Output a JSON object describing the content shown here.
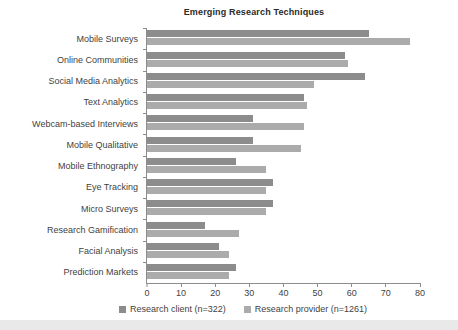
{
  "chart_data": {
    "type": "bar",
    "orientation": "horizontal",
    "title": "Emerging Research Techniques",
    "xlabel": "",
    "ylabel": "",
    "xlim": [
      0,
      80
    ],
    "xticks": [
      0,
      10,
      20,
      30,
      40,
      50,
      60,
      70,
      80
    ],
    "grid": false,
    "legend_position": "bottom",
    "categories": [
      "Mobile Surveys",
      "Online Communities",
      "Social Media Analytics",
      "Text Analytics",
      "Webcam-based Interviews",
      "Mobile Qualitative",
      "Mobile Ethnography",
      "Eye Tracking",
      "Micro Surveys",
      "Research Gamification",
      "Facial Analysis",
      "Prediction Markets"
    ],
    "series": [
      {
        "name": "Research client (n=322)",
        "color": "#8c8c8c",
        "values": [
          65,
          58,
          64,
          46,
          31,
          31,
          26,
          37,
          37,
          17,
          21,
          26
        ]
      },
      {
        "name": "Research provider (n=1261)",
        "color": "#ababab",
        "values": [
          77,
          59,
          49,
          47,
          46,
          45,
          35,
          35,
          35,
          27,
          24,
          24
        ]
      }
    ]
  },
  "legend": {
    "items": [
      {
        "label": "Research client (n=322)",
        "color": "#8c8c8c"
      },
      {
        "label": "Research provider (n=1261)",
        "color": "#ababab"
      }
    ]
  }
}
